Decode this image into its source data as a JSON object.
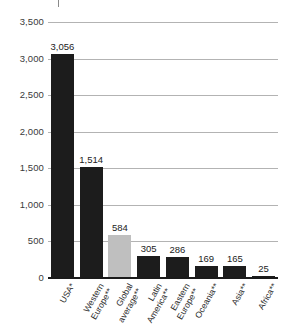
{
  "chart_data": {
    "type": "bar",
    "title": "",
    "subtitle": "",
    "xlabel": "",
    "ylabel": "",
    "ylim": [
      0,
      3500
    ],
    "ytick_step": 500,
    "yticks": [
      "0",
      "500",
      "1,000",
      "1,500",
      "2,000",
      "2,500",
      "3,000",
      "3,500"
    ],
    "grid": true,
    "legend": "none",
    "categories": [
      "USA*",
      "Western Europe**",
      "Global average**",
      "Latin America**",
      "Eastern Europe**",
      "Oceania**",
      "Asia**",
      "Africa**"
    ],
    "values": [
      3056,
      1514,
      584,
      305,
      286,
      169,
      165,
      25
    ],
    "value_labels": [
      "3,056",
      "1,514",
      "584",
      "305",
      "286",
      "169",
      "165",
      "25"
    ],
    "bar_colors": [
      "#1c1c1c",
      "#1c1c1c",
      "#bfbfbf",
      "#1c1c1c",
      "#1c1c1c",
      "#1c1c1c",
      "#1c1c1c",
      "#1c1c1c"
    ],
    "highlight_category": "Global average**",
    "highlight_color": "#bfbfbf",
    "series_color": "#1c1c1c",
    "gridline_color": "#b3b3b3",
    "axis_color": "#1a1a1a"
  },
  "category_lines": [
    [
      "USA*",
      ""
    ],
    [
      "Western",
      "Europe**"
    ],
    [
      "Global",
      "average**"
    ],
    [
      "Latin",
      "America**"
    ],
    [
      "Eastern",
      "Europe**"
    ],
    [
      "Oceania**",
      ""
    ],
    [
      "Asia**",
      ""
    ],
    [
      "Africa**",
      ""
    ]
  ]
}
